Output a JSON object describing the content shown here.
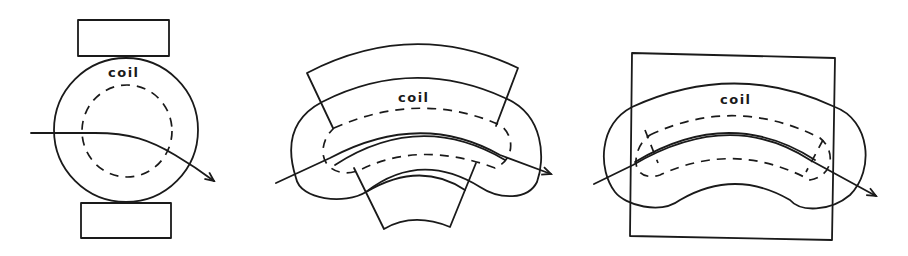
{
  "figures": [
    {
      "id": "circular-coil",
      "label": "coil",
      "description": "Circular coil between two rectangular pole pieces with curved particle trajectory"
    },
    {
      "id": "curved-sector-coil",
      "label": "coil",
      "description": "Kidney-shaped coil wrapped around curved sector pole piece with trajectory"
    },
    {
      "id": "kidney-coil-in-square",
      "label": "coil",
      "description": "Kidney-shaped coil overlapping a square yoke with trajectory"
    }
  ],
  "colors": {
    "stroke": "#1a1a1a",
    "background": "#ffffff"
  }
}
